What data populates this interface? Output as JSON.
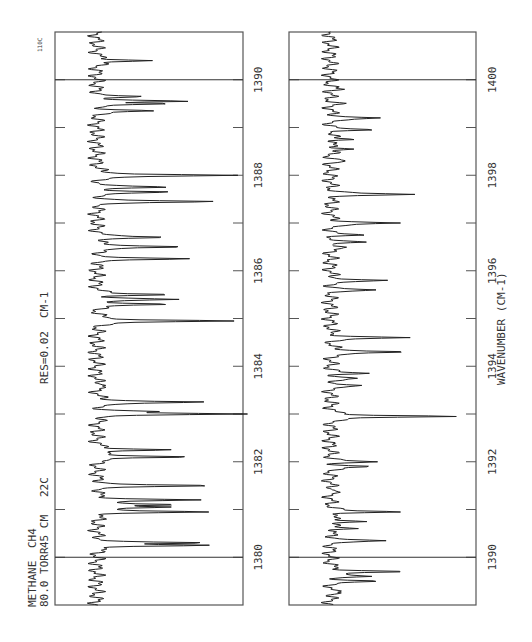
{
  "chart_data": [
    {
      "type": "line",
      "panel": "upper",
      "title": "METHANE CH4 absorption spectrum",
      "annotations": [
        "METHANE",
        "CH4",
        "80.0 TORR",
        "45 CM",
        "22C",
        "RES=0.02 CM-1",
        "110C"
      ],
      "xlabel": "",
      "ylabel": "",
      "xlim": [
        1379,
        1391
      ],
      "x_ticks": [
        1380,
        1381,
        1382,
        1383,
        1384,
        1385,
        1386,
        1387,
        1388,
        1389,
        1390
      ],
      "x_tick_labels": [
        "1380",
        "1382",
        "1384",
        "1386",
        "1388",
        "1390"
      ],
      "grid": false,
      "reference_lines": [
        1380,
        1390
      ],
      "series": [
        {
          "name": "transmittance",
          "absorption_peaks": [
            {
              "x": 1380.25,
              "depth": 0.8
            },
            {
              "x": 1380.3,
              "depth": 0.75
            },
            {
              "x": 1380.95,
              "depth": 0.78
            },
            {
              "x": 1381.05,
              "depth": 0.58
            },
            {
              "x": 1381.1,
              "depth": 0.62
            },
            {
              "x": 1381.2,
              "depth": 0.72
            },
            {
              "x": 1381.5,
              "depth": 0.78
            },
            {
              "x": 1382.1,
              "depth": 0.7
            },
            {
              "x": 1382.25,
              "depth": 0.55
            },
            {
              "x": 1383.0,
              "depth": 1.0
            },
            {
              "x": 1383.05,
              "depth": 0.45
            },
            {
              "x": 1383.25,
              "depth": 0.82
            },
            {
              "x": 1383.6,
              "depth": 0.12
            },
            {
              "x": 1384.95,
              "depth": 0.98
            },
            {
              "x": 1385.3,
              "depth": 0.55
            },
            {
              "x": 1385.4,
              "depth": 0.55
            },
            {
              "x": 1385.5,
              "depth": 0.55
            },
            {
              "x": 1386.25,
              "depth": 0.6
            },
            {
              "x": 1386.5,
              "depth": 0.7
            },
            {
              "x": 1386.7,
              "depth": 0.55
            },
            {
              "x": 1387.45,
              "depth": 0.82
            },
            {
              "x": 1387.65,
              "depth": 0.52
            },
            {
              "x": 1387.75,
              "depth": 0.5
            },
            {
              "x": 1388.0,
              "depth": 1.0
            },
            {
              "x": 1389.35,
              "depth": 0.4
            },
            {
              "x": 1389.5,
              "depth": 0.48
            },
            {
              "x": 1389.55,
              "depth": 0.7
            },
            {
              "x": 1389.65,
              "depth": 0.28
            },
            {
              "x": 1390.4,
              "depth": 0.4
            }
          ]
        }
      ]
    },
    {
      "type": "line",
      "panel": "lower",
      "xlabel": "WAVENUMBER (CM-1)",
      "ylabel": "",
      "xlim": [
        1389,
        1401
      ],
      "x_ticks": [
        1390,
        1391,
        1392,
        1393,
        1394,
        1395,
        1396,
        1397,
        1398,
        1399,
        1400
      ],
      "x_tick_labels": [
        "1390",
        "1392",
        "1394",
        "1396",
        "1398",
        "1400"
      ],
      "grid": false,
      "reference_lines": [
        1390,
        1400
      ],
      "series": [
        {
          "name": "transmittance",
          "absorption_peaks": [
            {
              "x": 1389.25,
              "depth": 0.12
            },
            {
              "x": 1389.5,
              "depth": 0.3
            },
            {
              "x": 1389.6,
              "depth": 0.32
            },
            {
              "x": 1389.7,
              "depth": 0.55
            },
            {
              "x": 1390.35,
              "depth": 0.38
            },
            {
              "x": 1390.6,
              "depth": 0.2
            },
            {
              "x": 1390.75,
              "depth": 0.28
            },
            {
              "x": 1390.95,
              "depth": 0.5
            },
            {
              "x": 1391.4,
              "depth": 0.08
            },
            {
              "x": 1391.9,
              "depth": 0.3
            },
            {
              "x": 1392.0,
              "depth": 0.3
            },
            {
              "x": 1392.95,
              "depth": 0.92
            },
            {
              "x": 1393.6,
              "depth": 0.25
            },
            {
              "x": 1393.75,
              "depth": 0.2
            },
            {
              "x": 1393.85,
              "depth": 0.25
            },
            {
              "x": 1394.3,
              "depth": 0.62
            },
            {
              "x": 1394.6,
              "depth": 0.52
            },
            {
              "x": 1395.6,
              "depth": 0.3
            },
            {
              "x": 1395.8,
              "depth": 0.4
            },
            {
              "x": 1396.5,
              "depth": 0.16
            },
            {
              "x": 1396.6,
              "depth": 0.2
            },
            {
              "x": 1396.75,
              "depth": 0.2
            },
            {
              "x": 1397.0,
              "depth": 0.52
            },
            {
              "x": 1397.6,
              "depth": 0.58
            },
            {
              "x": 1398.3,
              "depth": 0.1
            },
            {
              "x": 1398.55,
              "depth": 0.18
            },
            {
              "x": 1398.75,
              "depth": 0.18
            },
            {
              "x": 1398.95,
              "depth": 0.28
            },
            {
              "x": 1399.2,
              "depth": 0.38
            },
            {
              "x": 1399.5,
              "depth": 0.06
            },
            {
              "x": 1399.8,
              "depth": 0.08
            }
          ]
        }
      ]
    }
  ],
  "labels": {
    "sample_name": "METHANE",
    "formula": "CH4",
    "pressure": "80.0 TORR",
    "path_length": "45 CM",
    "temperature": "22C",
    "resolution": "RES=0.02",
    "resolution_unit": "CM-1",
    "corner_tag": "110C",
    "x_axis_title": "WAVENUMBER (CM-1)",
    "upper_ticks": [
      "1380",
      "1382",
      "1384",
      "1386",
      "1388",
      "1390"
    ],
    "lower_ticks": [
      "1390",
      "1392",
      "1394",
      "1396",
      "1398",
      "1400"
    ]
  },
  "colors": {
    "ink": "#222222",
    "frame": "#555555",
    "background": "#ffffff"
  }
}
